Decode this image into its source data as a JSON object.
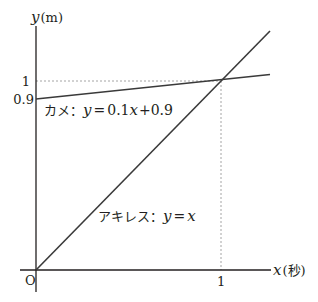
{
  "figure": {
    "top_clipped_text": "",
    "y_axis": {
      "var": "y",
      "unit": "(m)"
    },
    "x_axis": {
      "var": "x",
      "unit": "(秒)"
    },
    "origin_label": "O",
    "y_ticks": [
      {
        "label": "1",
        "value": 1
      },
      {
        "label": "0.9",
        "value": 0.9
      }
    ],
    "x_ticks": [
      {
        "label": "1",
        "value": 1
      }
    ],
    "lines": [
      {
        "name": "kame",
        "label_prefix": "カメ：",
        "equation": "y = 0.1x + 0.9",
        "eq_y": "y",
        "eq_eq": "=",
        "eq_rhs_a": "0.1",
        "eq_x": "x",
        "eq_rhs_b": "+0.9",
        "slope": 0.1,
        "intercept": 0.9
      },
      {
        "name": "achilles",
        "label_prefix": "アキレス：",
        "equation": "y = x",
        "eq_y": "y",
        "eq_eq": "=",
        "eq_x": "x",
        "slope": 1,
        "intercept": 0
      }
    ],
    "intersection": {
      "x": 1,
      "y": 1
    },
    "colors": {
      "axis": "#231f20",
      "line": "#3a3a3a",
      "guide": "#9a9a9a"
    }
  }
}
